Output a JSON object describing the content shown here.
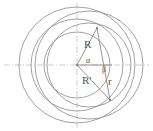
{
  "figure": {
    "type": "geometry-diagram",
    "title": "",
    "background_color": "#ffffff",
    "stroke_color": "#8a8a8a",
    "axis_color": "#b9b9b9",
    "label_color": "#555555",
    "center": {
      "x": 77,
      "y": 65
    }
  },
  "labels": {
    "radius_outer": "R",
    "radius_inner": "R'",
    "radius_small": "r",
    "angle_alpha": "α",
    "angle_beta": "β"
  },
  "geometry": {
    "axes": {
      "horizontal_y": 65,
      "vertical_x": 77,
      "style": "dash-dot"
    },
    "concentric_circles": [
      {
        "name": "outer-circle",
        "cx": 77,
        "cy": 65,
        "r": 58
      },
      {
        "name": "middle-circle",
        "cx": 77,
        "cy": 65,
        "r": 46
      },
      {
        "name": "inner-circle",
        "cx": 77,
        "cy": 65,
        "r": 33
      }
    ],
    "offset_circles": [
      {
        "name": "offset-circle-large",
        "cx": 89,
        "cy": 65,
        "r": 54
      },
      {
        "name": "offset-circle-small",
        "cx": 89,
        "cy": 65,
        "r": 42
      }
    ],
    "radial_lines": [
      {
        "name": "line-R",
        "x1": 77,
        "y1": 65,
        "x2": 97,
        "y2": 28
      },
      {
        "name": "line-Rprime",
        "x1": 77,
        "y1": 65,
        "x2": 110,
        "y2": 100
      },
      {
        "name": "line-r",
        "x1": 97,
        "y1": 28,
        "x2": 110,
        "y2": 100
      },
      {
        "name": "line-chord",
        "x1": 77,
        "y1": 65,
        "x2": 112,
        "y2": 65
      }
    ],
    "points": [
      {
        "name": "point-center",
        "x": 77,
        "y": 65
      },
      {
        "name": "point-upper",
        "x": 97,
        "y": 28
      },
      {
        "name": "point-lower",
        "x": 110,
        "y": 100
      }
    ]
  }
}
